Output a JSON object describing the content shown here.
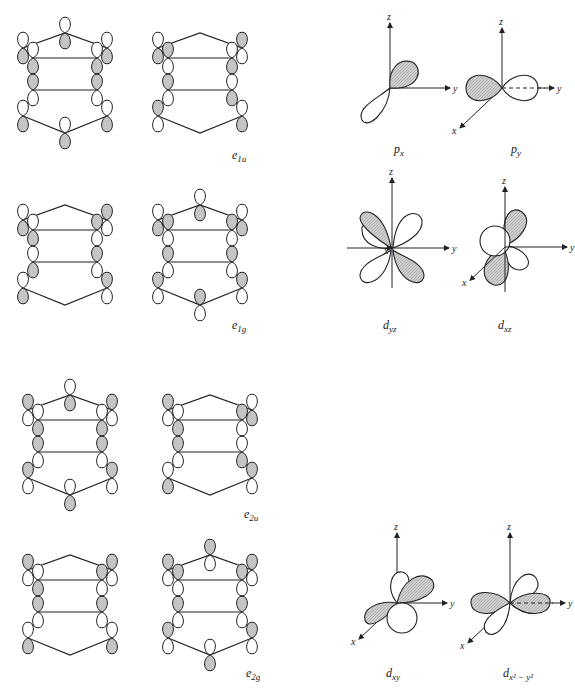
{
  "figure": {
    "shading_color": "#c8c8c8",
    "line_color": "#222222"
  },
  "ligand_sets": [
    {
      "symmetry": "e_1u",
      "label_main": "e",
      "label_sub": "1u"
    },
    {
      "symmetry": "e_1g",
      "label_main": "e",
      "label_sub": "1g"
    },
    {
      "symmetry": "e_2u",
      "label_main": "e",
      "label_sub": "2u"
    },
    {
      "symmetry": "e_2g",
      "label_main": "e",
      "label_sub": "2g"
    }
  ],
  "metal_orbitals": [
    {
      "name": "p_x",
      "label_main": "p",
      "label_sub": "x"
    },
    {
      "name": "p_y",
      "label_main": "p",
      "label_sub": "y"
    },
    {
      "name": "d_yz",
      "label_main": "d",
      "label_sub": "yz"
    },
    {
      "name": "d_xz",
      "label_main": "d",
      "label_sub": "xz"
    },
    {
      "name": "d_xy",
      "label_main": "d",
      "label_sub": "xy"
    },
    {
      "name": "d_x2-y2",
      "label_main": "d",
      "label_sub": "x² − y²"
    }
  ],
  "axes": {
    "x": "x",
    "y": "y",
    "z": "z"
  }
}
